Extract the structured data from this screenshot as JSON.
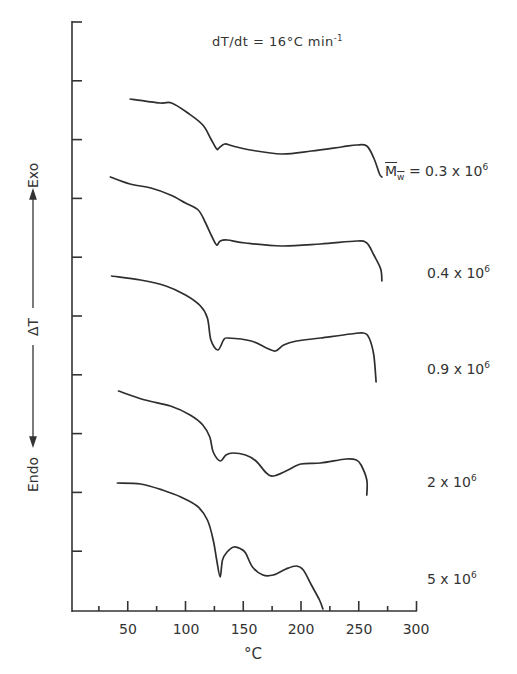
{
  "chart_data": {
    "type": "line",
    "title_parts": {
      "lhs": "dT/dt = 16",
      "deg": "°",
      "unit": "C min",
      "exp": "-1"
    },
    "xlabel": "°C",
    "ylabel": "ΔT",
    "ylabel_top": "Exo",
    "ylabel_bottom": "Endo",
    "xlim": [
      0,
      300
    ],
    "xticks_major": [
      50,
      100,
      150,
      200,
      250,
      300
    ],
    "xticks_minor": [
      25,
      75,
      125,
      175,
      225,
      275
    ],
    "xtick_labels": [
      "50",
      "100",
      "150",
      "200",
      "250",
      "300"
    ],
    "y_ticks_count": 10,
    "grid": false,
    "legend_position": "right, inline labels per curve",
    "series_label_prefix": "M̄w =",
    "series": [
      {
        "name": "0.3 x 10^6",
        "label_mantissa": "0.3 x 10",
        "label_exp": "6",
        "x": [
          52,
          78,
          88,
          102,
          115,
          122,
          127,
          129,
          134,
          141,
          156,
          183,
          209,
          235,
          248,
          257,
          263,
          268,
          270
        ],
        "y_px": [
          99,
          103,
          103,
          113,
          125,
          139,
          149,
          148,
          144,
          146,
          150,
          154,
          151,
          147,
          145,
          146,
          158,
          174,
          177
        ]
      },
      {
        "name": "0.4 x 10^6",
        "label_mantissa": "0.4 x 10",
        "label_exp": "6",
        "x": [
          35,
          52,
          70,
          87,
          100,
          111,
          117,
          123,
          127,
          130,
          136,
          152,
          183,
          217,
          248,
          257,
          263,
          269,
          270
        ],
        "y_px": [
          177,
          184,
          188,
          195,
          203,
          210,
          222,
          237,
          245,
          241,
          240,
          243,
          246,
          244,
          241,
          243,
          255,
          269,
          281
        ]
      },
      {
        "name": "0.9 x 10^6",
        "label_mantissa": "0.9 x 10",
        "label_exp": "6",
        "x": [
          36,
          61,
          83,
          100,
          113,
          119,
          122,
          128,
          133,
          137,
          157,
          170,
          178,
          185,
          196,
          217,
          243,
          254,
          259,
          263,
          265
        ],
        "y_px": [
          276,
          280,
          286,
          295,
          306,
          318,
          340,
          350,
          340,
          338,
          341,
          348,
          351,
          345,
          341,
          338,
          334,
          333,
          338,
          355,
          382
        ]
      },
      {
        "name": "2 x 10^6",
        "label_mantissa": "2 x 10",
        "label_exp": "6",
        "x": [
          42,
          65,
          87,
          104,
          115,
          121,
          124,
          130,
          135,
          141,
          152,
          161,
          170,
          176,
          187,
          200,
          217,
          239,
          248,
          252,
          257,
          257
        ],
        "y_px": [
          391,
          400,
          406,
          415,
          425,
          437,
          452,
          461,
          455,
          453,
          455,
          461,
          473,
          476,
          471,
          464,
          463,
          459,
          460,
          465,
          480,
          495
        ]
      },
      {
        "name": "5 x 10^6",
        "label_mantissa": "5 x 10",
        "label_exp": "6",
        "x": [
          41,
          61,
          80,
          96,
          110,
          119,
          124,
          127,
          130,
          132,
          136,
          142,
          148,
          152,
          158,
          167,
          176,
          187,
          196,
          202,
          209,
          216,
          219
        ],
        "y_px": [
          483,
          484,
          490,
          497,
          506,
          520,
          540,
          560,
          577,
          560,
          552,
          547,
          549,
          553,
          567,
          575,
          575,
          569,
          566,
          570,
          585,
          600,
          609
        ]
      }
    ],
    "features": {
      "melting_endotherm_°C": 128,
      "second_endotherm_°C_for_high_Mw": 175
    }
  },
  "style": {
    "line_color": "#2e2e2e",
    "axis_color": "#333333",
    "background": "#ffffff"
  }
}
